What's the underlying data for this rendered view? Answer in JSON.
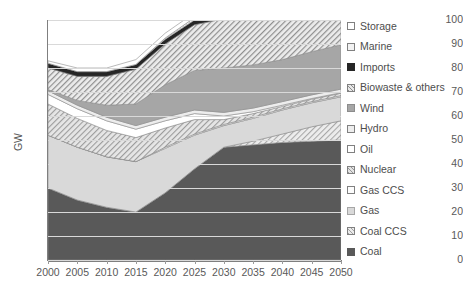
{
  "chart_data": {
    "type": "area",
    "stacked": true,
    "title": "",
    "xlabel": "",
    "ylabel": "GW",
    "ylim": [
      0,
      100
    ],
    "ytick_step": 10,
    "yticks": [
      0,
      10,
      20,
      30,
      40,
      50,
      60,
      70,
      80,
      90,
      100
    ],
    "grid": true,
    "legend_position": "right",
    "categories": [
      2000,
      2005,
      2010,
      2015,
      2020,
      2025,
      2030,
      2035,
      2040,
      2045,
      2050
    ],
    "xticklabels": [
      "2000",
      "2005",
      "2010",
      "2015",
      "2020",
      "2025",
      "2030",
      "2035",
      "2040",
      "2045",
      "2050"
    ],
    "stack_order_bottom_to_top": [
      "Coal",
      "Coal CCS",
      "Gas",
      "Gas CCS",
      "Nuclear",
      "Oil",
      "Hydro",
      "Wind",
      "Biowaste & others",
      "Imports",
      "Marine",
      "Storage"
    ],
    "series": [
      {
        "name": "Coal",
        "values": [
          30.0,
          25.0,
          22.0,
          20.0,
          28.0,
          38.0,
          47.0,
          48.0,
          49.0,
          49.5,
          50.0
        ]
      },
      {
        "name": "Coal CCS",
        "values": [
          0.0,
          0.0,
          0.0,
          0.0,
          0.0,
          0.0,
          0.0,
          1.5,
          3.5,
          6.0,
          8.0
        ]
      },
      {
        "name": "Gas",
        "values": [
          22.0,
          22.0,
          21.0,
          21.0,
          18.5,
          14.0,
          9.0,
          9.5,
          10.0,
          10.0,
          10.0
        ]
      },
      {
        "name": "Gas CCS",
        "values": [
          0.0,
          0.0,
          0.0,
          0.0,
          0.5,
          0.5,
          0.5,
          0.5,
          0.5,
          0.5,
          0.5
        ]
      },
      {
        "name": "Nuclear",
        "values": [
          13.0,
          12.0,
          11.0,
          10.0,
          8.0,
          6.0,
          2.0,
          1.5,
          1.0,
          1.0,
          1.0
        ]
      },
      {
        "name": "Oil",
        "values": [
          4.0,
          4.0,
          4.0,
          3.5,
          3.0,
          2.5,
          1.5,
          0.8,
          0.5,
          0.3,
          0.2
        ]
      },
      {
        "name": "Hydro",
        "values": [
          1.5,
          1.5,
          1.5,
          1.5,
          1.5,
          1.5,
          1.5,
          1.5,
          1.5,
          1.5,
          1.5
        ]
      },
      {
        "name": "Wind",
        "values": [
          0.5,
          2.0,
          5.0,
          9.0,
          13.5,
          16.5,
          18.5,
          18.0,
          17.5,
          18.0,
          18.5
        ]
      },
      {
        "name": "Biowaste & others",
        "values": [
          9.0,
          10.0,
          12.0,
          14.5,
          17.0,
          19.0,
          20.5,
          21.5,
          21.5,
          20.0,
          19.0
        ]
      },
      {
        "name": "Imports",
        "values": [
          2.0,
          2.0,
          2.0,
          2.0,
          2.0,
          2.0,
          2.0,
          2.0,
          2.0,
          2.0,
          2.0
        ]
      },
      {
        "name": "Marine",
        "values": [
          0.0,
          0.0,
          0.0,
          0.0,
          0.5,
          1.0,
          1.5,
          2.5,
          3.5,
          4.5,
          5.0
        ]
      },
      {
        "name": "Storage",
        "values": [
          1.0,
          1.5,
          1.5,
          2.0,
          2.0,
          2.0,
          2.0,
          2.0,
          2.0,
          2.2,
          2.3
        ]
      }
    ],
    "totals": [
      83.0,
      80.0,
      80.0,
      83.5,
      84.5,
      86.5,
      88.0,
      90.0,
      92.5,
      95.5,
      98.0
    ]
  },
  "axes": {
    "y_title": "GW",
    "y_labels": [
      "100",
      "90",
      "80",
      "70",
      "60",
      "50",
      "40",
      "30",
      "20",
      "10",
      "0"
    ],
    "x_labels": [
      "2000",
      "2005",
      "2010",
      "2015",
      "2020",
      "2025",
      "2030",
      "2035",
      "2040",
      "2045",
      "2050"
    ]
  },
  "legend": {
    "items": [
      {
        "label": "Storage",
        "swatch": "storage",
        "color": "#ffffff"
      },
      {
        "label": "Marine",
        "swatch": "marine",
        "color": "#f2f2f2"
      },
      {
        "label": "Imports",
        "swatch": "imports",
        "color": "#262626"
      },
      {
        "label": "Biowaste & others",
        "swatch": "biowaste",
        "color": "#e8e8e8"
      },
      {
        "label": "Wind",
        "swatch": "wind",
        "color": "#a6a6a6"
      },
      {
        "label": "Hydro",
        "swatch": "hydro",
        "color": "#ededed"
      },
      {
        "label": "Oil",
        "swatch": "oil",
        "color": "#ffffff"
      },
      {
        "label": "Nuclear",
        "swatch": "nuclear",
        "color": "#e3e3e3"
      },
      {
        "label": "Gas CCS",
        "swatch": "gasccs",
        "color": "#fcfcfc"
      },
      {
        "label": "Gas",
        "swatch": "gas",
        "color": "#d9d9d9"
      },
      {
        "label": "Coal CCS",
        "swatch": "coalccs",
        "color": "#ebebeb"
      },
      {
        "label": "Coal",
        "swatch": "coal",
        "color": "#595959"
      }
    ]
  }
}
